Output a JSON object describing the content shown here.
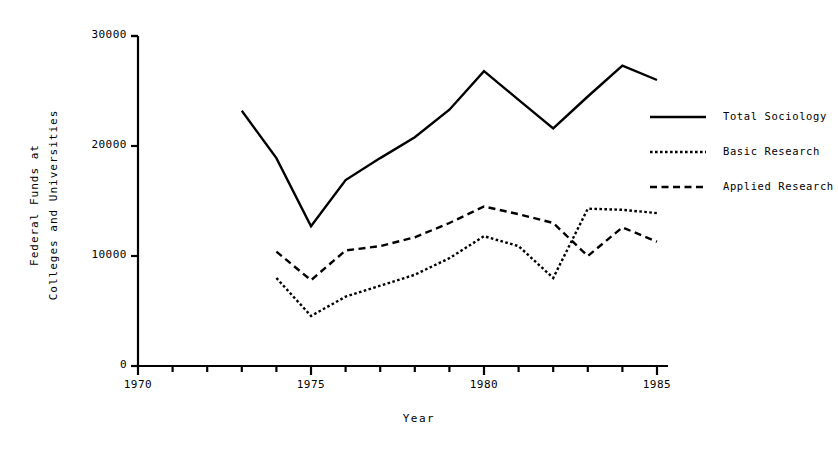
{
  "chart_data": {
    "type": "line",
    "title": "",
    "xlabel": "Year",
    "ylabel": "Federal Funds at\nColleges and Universities",
    "ylabel_line1": "Federal Funds at",
    "ylabel_line2": "Colleges and Universities",
    "xlim": [
      1970,
      1985
    ],
    "ylim": [
      0,
      30000
    ],
    "xticks": [
      1970,
      1971,
      1972,
      1973,
      1974,
      1975,
      1976,
      1977,
      1978,
      1979,
      1980,
      1981,
      1982,
      1983,
      1984,
      1985
    ],
    "xtick_labels": [
      "1970",
      "",
      "",
      "",
      "",
      "1975",
      "",
      "",
      "",
      "",
      "1980",
      "",
      "",
      "",
      "",
      "1985"
    ],
    "xtick_labels_major": [
      "1970",
      "1975",
      "1980",
      "1985"
    ],
    "yticks": [
      0,
      10000,
      20000,
      30000
    ],
    "ytick_labels": [
      "0",
      "10000",
      "20000",
      "30000"
    ],
    "grid": false,
    "legend_position": "right",
    "series": [
      {
        "name": "Total Sociology",
        "style": "solid",
        "color": "#000000",
        "x": [
          1973,
          1974,
          1975,
          1976,
          1977,
          1978,
          1979,
          1980,
          1981,
          1982,
          1983,
          1984,
          1985
        ],
        "values": [
          23200,
          18900,
          12700,
          16900,
          18900,
          20800,
          23300,
          26800,
          24200,
          21600,
          24500,
          27300,
          26000
        ]
      },
      {
        "name": "Basic Research",
        "style": "dotted",
        "color": "#000000",
        "x": [
          1974,
          1975,
          1976,
          1977,
          1978,
          1979,
          1980,
          1981,
          1982,
          1983,
          1984,
          1985
        ],
        "values": [
          8000,
          4550,
          6300,
          7300,
          8300,
          9800,
          11800,
          10900,
          8000,
          14300,
          14200,
          13900
        ]
      },
      {
        "name": "Applied Research",
        "style": "dashed",
        "color": "#000000",
        "x": [
          1974,
          1975,
          1976,
          1977,
          1978,
          1979,
          1980,
          1981,
          1982,
          1983,
          1984,
          1985
        ],
        "values": [
          10400,
          7800,
          10500,
          10900,
          11700,
          13000,
          14500,
          13800,
          13000,
          10000,
          12600,
          11300
        ]
      }
    ]
  },
  "legend": {
    "items": [
      {
        "label": "Total Sociology",
        "style": "solid"
      },
      {
        "label": "Basic Research",
        "style": "dotted"
      },
      {
        "label": "Applied Research",
        "style": "dashed"
      }
    ]
  },
  "axes": {
    "x_title": "Year",
    "y_title_line1": "Federal Funds at",
    "y_title_line2": "Colleges and Universities",
    "y_labels": [
      "30000",
      "20000",
      "10000",
      "0"
    ],
    "x_labels": [
      "1970",
      "1975",
      "1980",
      "1985"
    ]
  }
}
